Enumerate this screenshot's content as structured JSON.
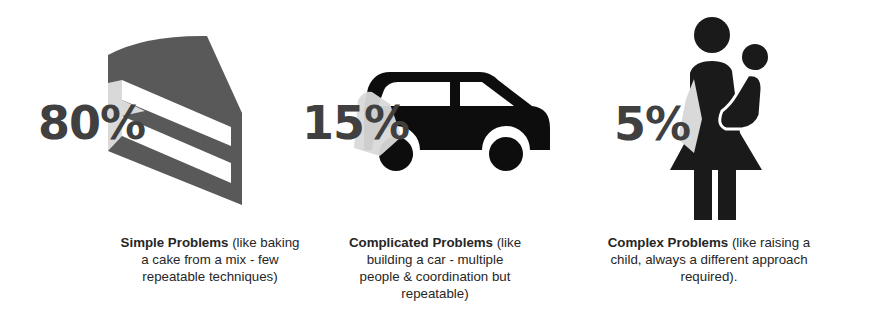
{
  "panels": [
    {
      "id": "simple",
      "percent": "80%",
      "icon": "cake-slice-icon",
      "title": "Simple Problems",
      "description_lines": [
        " (like baking",
        "a cake from a mix - few",
        "repeatable techniques)"
      ]
    },
    {
      "id": "complicated",
      "percent": "15%",
      "icon": "car-icon",
      "title": "Complicated Problems",
      "description_lines": [
        " (like",
        "building a car - multiple",
        "people & coordination but",
        "repeatable)"
      ]
    },
    {
      "id": "complex",
      "percent": "5%",
      "icon": "mother-child-icon",
      "title": "Complex Problems",
      "description_lines": [
        " (like raising a",
        "child, always a different approach",
        "required)."
      ]
    }
  ],
  "colors": {
    "cake": "#595959",
    "car": "#0d0d0d",
    "person": "#1a1a1a",
    "highlight": "#d9d9d9",
    "percent_text": "#404040"
  }
}
